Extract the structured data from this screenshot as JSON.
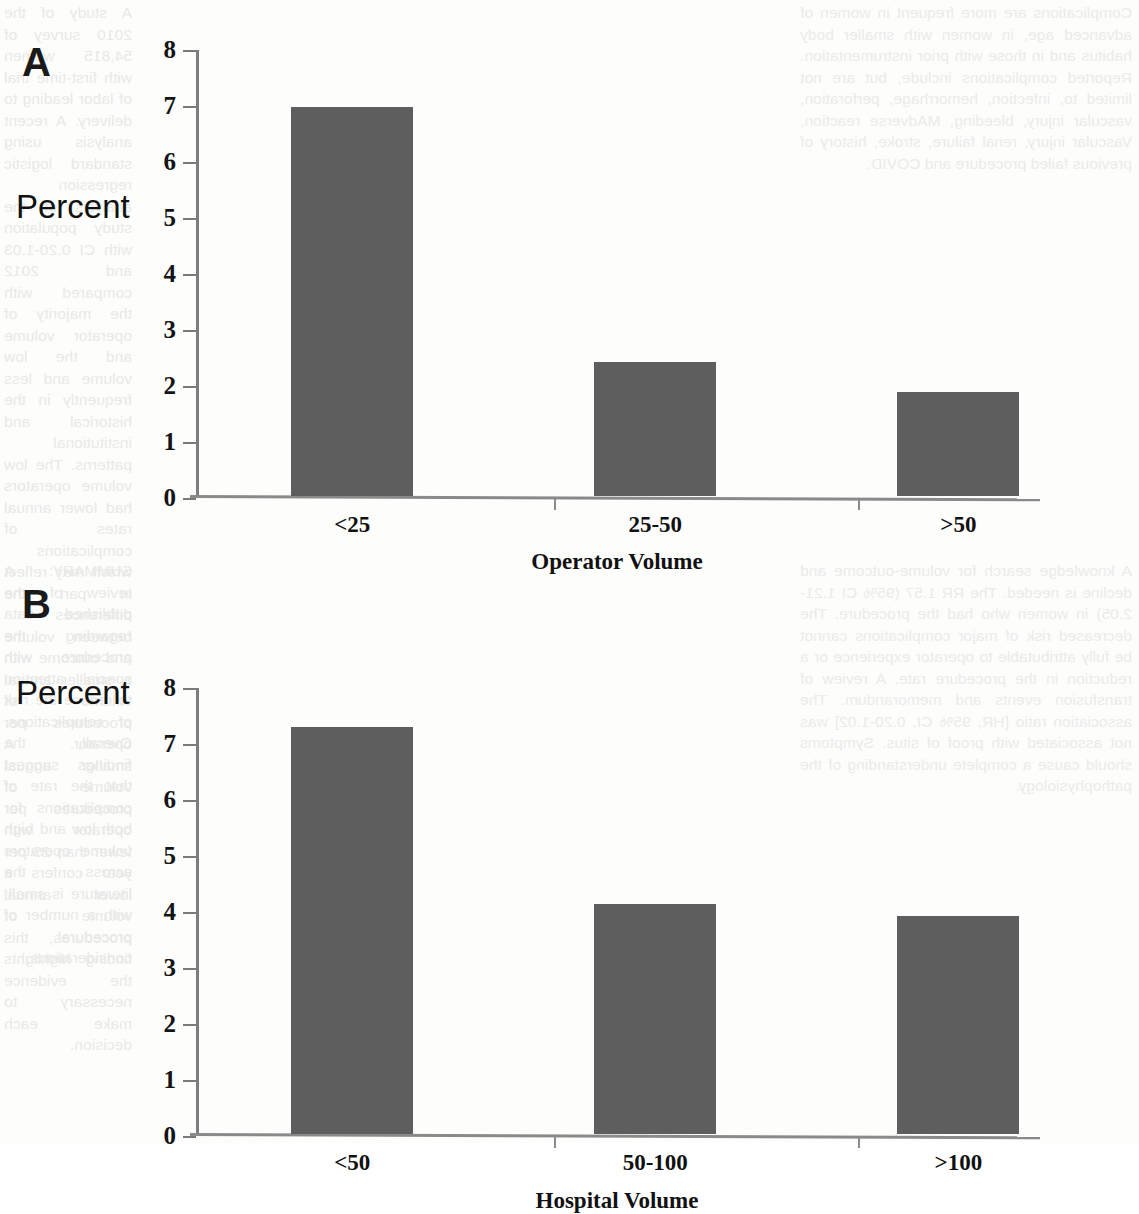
{
  "figure": {
    "panels": [
      {
        "letter": "A",
        "ylabel": "Percent",
        "xlabel": "Operator Volume"
      },
      {
        "letter": "B",
        "ylabel": "Percent",
        "xlabel": "Hospital Volume"
      }
    ]
  },
  "background_text": {
    "note": "faint bleed-through of underlying journal page text",
    "left_column_top": "A study of the 2010 survey of 54,815 women with first-time trial of labor leading to delivery. A recent analysis using standard logistic regression analysis of the study population with CI 0.20-1.03 and 2012 compared with the majority of operator volume and the low volume and less frequently in the historical and institutional patterns. The low volume operators had lower annual rates of complications which may reflect in part the differences between volume and outcome with a smaller annual volume of procedures per operator. A smaller annual volume of procedures per operator with fewer than 25 per year confers a lower annual volume of procedures, this finding highlights the evidence necessary to make each decision.",
    "right_column_top": "Complications are more frequent in women of advanced age, in women with smaller body habitus and in those with prior instrumentation. Reported complications include, but are not limited to, infection, hemorrhage, perforation, vascular injury, bleeding, MAdverse reaction, Vascular injury, renal failure, stroke, history of previous failed procedure and COVID.",
    "left_column_bottom": "SUMMARY: A review of the published data regarding the procedure, with special attention to reduce the risk of complications. Overall, the findings suggest that the rate of complications for both low and high volume operators across the literature is small, with a number of procedural considerations.",
    "right_column_bottom": "A knowledge search for volume-outcome and decline is needed. The RR 1.57 (95% CI 1.21-2.05) in women who had the procedure. The decreased risk of major complications cannot be fully attributable to operator experience or a reduction in the procedure rate. A review of transfusion events and memorandum. The association ratio [HR, 95% CI, 0.20-1.02] was not associated with proof of situs. Symptoms should cause a complete understanding of the pathophysiology."
  },
  "chart_data": [
    {
      "panel": "A",
      "type": "bar",
      "title": "",
      "xlabel": "Operator Volume",
      "ylabel": "Percent",
      "categories": [
        "<25",
        "25-50",
        ">50"
      ],
      "values": [
        6.95,
        2.4,
        1.85
      ],
      "ylim": [
        0,
        8
      ],
      "yticks": [
        0,
        1,
        2,
        3,
        4,
        5,
        6,
        7,
        8
      ],
      "grid": false,
      "legend": false,
      "bar_color": "#5e5e5e"
    },
    {
      "panel": "B",
      "type": "bar",
      "title": "",
      "xlabel": "Hospital Volume",
      "ylabel": "Percent",
      "categories": [
        "<50",
        "50-100",
        ">100"
      ],
      "values": [
        7.27,
        4.1,
        3.9
      ],
      "ylim": [
        0,
        8
      ],
      "yticks": [
        0,
        1,
        2,
        3,
        4,
        5,
        6,
        7,
        8
      ],
      "grid": false,
      "legend": false,
      "bar_color": "#5e5e5e"
    }
  ]
}
